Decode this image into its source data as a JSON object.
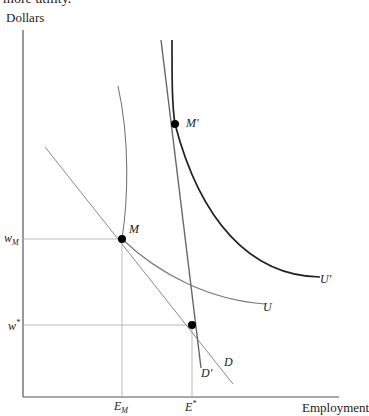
{
  "header": {
    "clipped_text": "more utility."
  },
  "axes": {
    "y_label": "Dollars",
    "x_label": "Employment"
  },
  "y_ticks": [
    {
      "label": "w",
      "sub": "M",
      "y": 239
    },
    {
      "label": "w",
      "sup": "*",
      "y": 325
    }
  ],
  "x_ticks": [
    {
      "label": "E",
      "sub": "M",
      "x": 122
    },
    {
      "label": "E",
      "sup": "*",
      "x": 192
    }
  ],
  "points": [
    {
      "label": "M",
      "x": 122,
      "y": 239
    },
    {
      "label": "M'",
      "x": 175,
      "y": 124
    },
    {
      "label": "",
      "x": 192,
      "y": 325
    }
  ],
  "curves": [
    {
      "label": "D",
      "kind": "demand"
    },
    {
      "label": "D'",
      "kind": "demand"
    },
    {
      "label": "U",
      "kind": "indifference"
    },
    {
      "label": "U'",
      "kind": "indifference"
    }
  ],
  "labels": {
    "M": "M",
    "M_prime": "M'",
    "D": "D",
    "D_prime": "D'",
    "U": "U",
    "U_prime": "U'",
    "wM_main": "w",
    "wM_sub": "M",
    "wstar_main": "w",
    "wstar_sup": "*",
    "EM_main": "E",
    "EM_sub": "M",
    "Estar_main": "E",
    "Estar_sup": "*"
  },
  "colors": {
    "axis": "#555555",
    "thin_line": "#888888",
    "curve_U_prime": "#222222",
    "point": "#000000"
  }
}
